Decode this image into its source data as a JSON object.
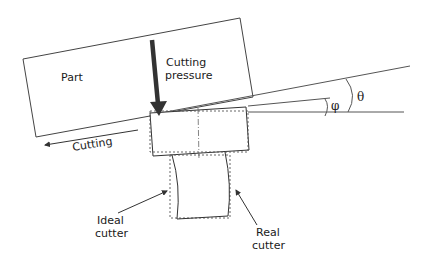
{
  "diagram": {
    "labels": {
      "part": "Part",
      "cutting_pressure_line1": "Cutting",
      "cutting_pressure_line2": "pressure",
      "cutting": "Cutting",
      "ideal_cutter_line1": "Ideal",
      "ideal_cutter_line2": "cutter",
      "real_cutter_line1": "Real",
      "real_cutter_line2": "cutter",
      "theta": "θ",
      "phi": "φ"
    },
    "colors": {
      "line": "#333333",
      "arrow": "#333333",
      "dashed": "#555555"
    }
  }
}
